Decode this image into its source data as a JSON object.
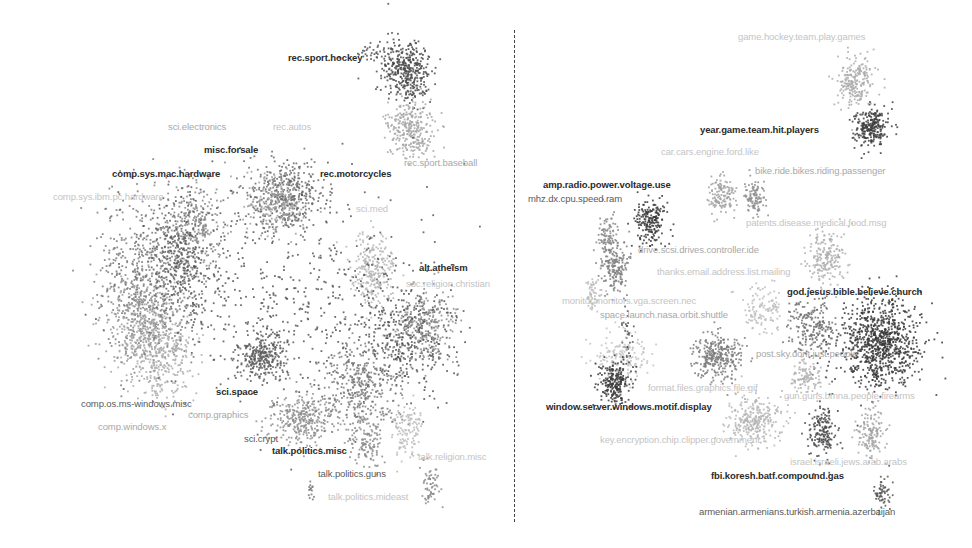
{
  "chart_data": [
    {
      "type": "scatter",
      "title": "",
      "panel": "left",
      "description": "2D embedding of documents colored by newsgroup category",
      "xlabel": "",
      "ylabel": "",
      "axes_visible": false,
      "grid": false,
      "labels": [
        {
          "text": "rec.sport.hockey",
          "x": 288,
          "y": 59,
          "tone": "dark"
        },
        {
          "text": "sci.electronics",
          "x": 168,
          "y": 128,
          "tone": "light"
        },
        {
          "text": "rec.autos",
          "x": 273,
          "y": 128,
          "tone": "faint"
        },
        {
          "text": "misc.forsale",
          "x": 204,
          "y": 151,
          "tone": "dark"
        },
        {
          "text": "comp.sys.mac.hardware",
          "x": 112,
          "y": 175,
          "tone": "dark"
        },
        {
          "text": "rec.motorcycles",
          "x": 320,
          "y": 175,
          "tone": "dark"
        },
        {
          "text": "rec.sport.baseball",
          "x": 404,
          "y": 164,
          "tone": "light"
        },
        {
          "text": "comp.sys.ibm.pc.hardware",
          "x": 53,
          "y": 198,
          "tone": "faint"
        },
        {
          "text": "sci.med",
          "x": 356,
          "y": 210,
          "tone": "faint"
        },
        {
          "text": "alt.atheism",
          "x": 419,
          "y": 269,
          "tone": "dark"
        },
        {
          "text": "soc.religion.christian",
          "x": 406,
          "y": 285,
          "tone": "faint"
        },
        {
          "text": "sci.space",
          "x": 216,
          "y": 393,
          "tone": "dark"
        },
        {
          "text": "comp.os.ms-windows.misc",
          "x": 81,
          "y": 405,
          "tone": "mid"
        },
        {
          "text": "comp.graphics",
          "x": 188,
          "y": 416,
          "tone": "light"
        },
        {
          "text": "comp.windows.x",
          "x": 98,
          "y": 428,
          "tone": "light"
        },
        {
          "text": "sci.crypt",
          "x": 244,
          "y": 440,
          "tone": "mid"
        },
        {
          "text": "talk.politics.misc",
          "x": 272,
          "y": 452,
          "tone": "dark"
        },
        {
          "text": "talk.religion.misc",
          "x": 418,
          "y": 458,
          "tone": "faint"
        },
        {
          "text": "talk.politics.guns",
          "x": 318,
          "y": 475,
          "tone": "mid"
        },
        {
          "text": "talk.politics.mideast",
          "x": 328,
          "y": 498,
          "tone": "faint"
        }
      ],
      "clusters": [
        {
          "name": "rec.sport.hockey",
          "cx": 406,
          "cy": 70,
          "sx": 12,
          "sy": 16,
          "n": 380,
          "shade": "#4a4a4a"
        },
        {
          "name": "rec.sport.baseball",
          "cx": 410,
          "cy": 128,
          "sx": 11,
          "sy": 14,
          "n": 300,
          "shade": "#a6a6a6"
        },
        {
          "name": "hockey-tail",
          "cx": 372,
          "cy": 50,
          "sx": 14,
          "sy": 6,
          "n": 40,
          "shade": "#555555"
        },
        {
          "name": "rec.motorcycles/autos",
          "cx": 285,
          "cy": 195,
          "sx": 20,
          "sy": 18,
          "n": 420,
          "shade": "#6a6a6a"
        },
        {
          "name": "rec.autos-light",
          "cx": 275,
          "cy": 205,
          "sx": 14,
          "sy": 14,
          "n": 200,
          "shade": "#9c9c9c"
        },
        {
          "name": "comp.sys.mac.hardware",
          "cx": 195,
          "cy": 225,
          "sx": 14,
          "sy": 22,
          "n": 260,
          "shade": "#8a8a8a"
        },
        {
          "name": "comp.sys.ibm.pc.hardware",
          "cx": 150,
          "cy": 280,
          "sx": 26,
          "sy": 42,
          "n": 700,
          "shade": "#7a7a7a"
        },
        {
          "name": "sci.electronics",
          "cx": 180,
          "cy": 260,
          "sx": 20,
          "sy": 30,
          "n": 350,
          "shade": "#5a5a5a"
        },
        {
          "name": "comp.os.ms-windows.misc",
          "cx": 158,
          "cy": 350,
          "sx": 18,
          "sy": 22,
          "n": 420,
          "shade": "#aaaaaa"
        },
        {
          "name": "comp.windows.x",
          "cx": 135,
          "cy": 320,
          "sx": 16,
          "sy": 20,
          "n": 260,
          "shade": "#9a9a9a"
        },
        {
          "name": "sci.space",
          "cx": 262,
          "cy": 355,
          "sx": 12,
          "sy": 12,
          "n": 300,
          "shade": "#5c5c5c"
        },
        {
          "name": "sci.med",
          "cx": 372,
          "cy": 268,
          "sx": 10,
          "sy": 18,
          "n": 260,
          "shade": "#b4b4b4"
        },
        {
          "name": "misc-scatter",
          "cx": 300,
          "cy": 300,
          "sx": 70,
          "sy": 55,
          "n": 500,
          "shade": "#555555"
        },
        {
          "name": "alt.atheism",
          "cx": 405,
          "cy": 335,
          "sx": 24,
          "sy": 26,
          "n": 380,
          "shade": "#505050"
        },
        {
          "name": "soc.religion.christian",
          "cx": 425,
          "cy": 325,
          "sx": 16,
          "sy": 22,
          "n": 260,
          "shade": "#8c8c8c"
        },
        {
          "name": "sci.crypt",
          "cx": 300,
          "cy": 420,
          "sx": 16,
          "sy": 12,
          "n": 320,
          "shade": "#8e8e8e"
        },
        {
          "name": "talk.politics.misc",
          "cx": 360,
          "cy": 385,
          "sx": 22,
          "sy": 22,
          "n": 400,
          "shade": "#7c7c7c"
        },
        {
          "name": "talk.politics.guns",
          "cx": 365,
          "cy": 440,
          "sx": 8,
          "sy": 14,
          "n": 120,
          "shade": "#8a8a8a"
        },
        {
          "name": "talk.religion.misc",
          "cx": 408,
          "cy": 430,
          "sx": 8,
          "sy": 16,
          "n": 120,
          "shade": "#b8b8b8"
        },
        {
          "name": "talk.politics.mideast",
          "cx": 430,
          "cy": 485,
          "sx": 5,
          "sy": 10,
          "n": 60,
          "shade": "#888888"
        },
        {
          "name": "guns-tail",
          "cx": 310,
          "cy": 490,
          "sx": 2,
          "sy": 6,
          "n": 15,
          "shade": "#777777"
        }
      ]
    },
    {
      "type": "scatter",
      "title": "",
      "panel": "right",
      "description": "2D embedding of documents with topic-keyword cluster labels",
      "xlabel": "",
      "ylabel": "",
      "axes_visible": false,
      "grid": false,
      "labels": [
        {
          "text": "game.hockey.team.play.games",
          "x": 738,
          "y": 38,
          "tone": "faint"
        },
        {
          "text": "year.game.team.hit.players",
          "x": 700,
          "y": 131,
          "tone": "dark"
        },
        {
          "text": "car.cars.engine.ford.like",
          "x": 661,
          "y": 153,
          "tone": "faint"
        },
        {
          "text": "bike.ride.bikes.riding.passenger",
          "x": 755,
          "y": 172,
          "tone": "light"
        },
        {
          "text": "amp.radio.power.voltage.use",
          "x": 543,
          "y": 186,
          "tone": "dark"
        },
        {
          "text": "mhz.dx.cpu.speed.ram",
          "x": 528,
          "y": 200,
          "tone": "mid"
        },
        {
          "text": "patents.disease.medical.food.msg",
          "x": 746,
          "y": 224,
          "tone": "faint"
        },
        {
          "text": "drive.scsi.drives.controller.ide",
          "x": 638,
          "y": 251,
          "tone": "light"
        },
        {
          "text": "thanks.email.address.list.mailing",
          "x": 657,
          "y": 273,
          "tone": "faint"
        },
        {
          "text": "god.jesus.bible.believe.church",
          "x": 787,
          "y": 293,
          "tone": "dark"
        },
        {
          "text": "monitor.monitors.vga.screen.nec",
          "x": 562,
          "y": 302,
          "tone": "faint"
        },
        {
          "text": "space.launch.nasa.orbit.shuttle",
          "x": 600,
          "y": 316,
          "tone": "light"
        },
        {
          "text": "post.sky.dont.just.people",
          "x": 756,
          "y": 355,
          "tone": "light"
        },
        {
          "text": "format.files.graphics.file.gif",
          "x": 648,
          "y": 389,
          "tone": "faint"
        },
        {
          "text": "gun.guns.bmna.people.firearms",
          "x": 784,
          "y": 397,
          "tone": "faint"
        },
        {
          "text": "window.server.windows.motif.display",
          "x": 546,
          "y": 408,
          "tone": "dark"
        },
        {
          "text": "key.encryption.chip.clipper.government",
          "x": 600,
          "y": 441,
          "tone": "faint"
        },
        {
          "text": "israel.israeli.jews.arab.arabs",
          "x": 790,
          "y": 463,
          "tone": "faint"
        },
        {
          "text": "fbi.koresh.batf.compound.gas",
          "x": 711,
          "y": 477,
          "tone": "dark"
        },
        {
          "text": "armenian.armenians.turkish.armenia.azerbaijan",
          "x": 699,
          "y": 513,
          "tone": "mid"
        }
      ],
      "clusters": [
        {
          "name": "game.hockey.team.play.games",
          "cx": 855,
          "cy": 80,
          "sx": 9,
          "sy": 13,
          "n": 220,
          "shade": "#aaaaaa"
        },
        {
          "name": "year.game.team.hit.players",
          "cx": 870,
          "cy": 127,
          "sx": 8,
          "sy": 9,
          "n": 260,
          "shade": "#3e3e3e"
        },
        {
          "name": "car.cars.engine.ford.like",
          "cx": 722,
          "cy": 192,
          "sx": 7,
          "sy": 9,
          "n": 130,
          "shade": "#a0a0a0"
        },
        {
          "name": "bike.ride.bikes.riding.passenger",
          "cx": 753,
          "cy": 197,
          "sx": 5,
          "sy": 9,
          "n": 110,
          "shade": "#8e8e8e"
        },
        {
          "name": "amp.radio.power.voltage.use",
          "cx": 650,
          "cy": 222,
          "sx": 7,
          "sy": 12,
          "n": 200,
          "shade": "#3a3a3a"
        },
        {
          "name": "mhz.dx.cpu.speed.ram",
          "cx": 607,
          "cy": 238,
          "sx": 5,
          "sy": 12,
          "n": 110,
          "shade": "#888888"
        },
        {
          "name": "drive.scsi.drives.controller.ide",
          "cx": 615,
          "cy": 268,
          "sx": 7,
          "sy": 12,
          "n": 160,
          "shade": "#7e7e7e"
        },
        {
          "name": "patents.disease.medical.food.msg",
          "cx": 827,
          "cy": 258,
          "sx": 10,
          "sy": 14,
          "n": 200,
          "shade": "#aeaeae"
        },
        {
          "name": "monitor.monitors.vga.screen.nec",
          "cx": 592,
          "cy": 292,
          "sx": 5,
          "sy": 8,
          "n": 60,
          "shade": "#bbbbbb"
        },
        {
          "name": "thanks.email.address.list.mailing",
          "cx": 763,
          "cy": 310,
          "sx": 10,
          "sy": 12,
          "n": 120,
          "shade": "#bcbcbc"
        },
        {
          "name": "god.jesus.bible.believe.church",
          "cx": 880,
          "cy": 340,
          "sx": 20,
          "sy": 22,
          "n": 900,
          "shade": "#383838"
        },
        {
          "name": "post.sky.dont.just.people",
          "cx": 812,
          "cy": 330,
          "sx": 12,
          "sy": 14,
          "n": 220,
          "shade": "#6e6e6e"
        },
        {
          "name": "space.launch.nasa.orbit.shuttle",
          "cx": 717,
          "cy": 355,
          "sx": 12,
          "sy": 12,
          "n": 300,
          "shade": "#7a7a7a"
        },
        {
          "name": "space-thread",
          "cx": 626,
          "cy": 335,
          "sx": 3,
          "sy": 12,
          "n": 35,
          "shade": "#555555"
        },
        {
          "name": "format.files.graphics.file.gif",
          "cx": 620,
          "cy": 355,
          "sx": 14,
          "sy": 12,
          "n": 150,
          "shade": "#c2c2c2"
        },
        {
          "name": "window.server.windows.motif.display",
          "cx": 615,
          "cy": 382,
          "sx": 8,
          "sy": 11,
          "n": 240,
          "shade": "#3c3c3c"
        },
        {
          "name": "gun.guns.bmna.people.firearms",
          "cx": 805,
          "cy": 377,
          "sx": 8,
          "sy": 9,
          "n": 110,
          "shade": "#b0b0b0"
        },
        {
          "name": "key.encryption.chip.clipper.government",
          "cx": 755,
          "cy": 420,
          "sx": 13,
          "sy": 12,
          "n": 300,
          "shade": "#b6b6b6"
        },
        {
          "name": "fbi.koresh.batf.compound.gas",
          "cx": 822,
          "cy": 432,
          "sx": 7,
          "sy": 14,
          "n": 170,
          "shade": "#484848"
        },
        {
          "name": "israel.israeli.jews.arab.arabs",
          "cx": 870,
          "cy": 432,
          "sx": 7,
          "sy": 14,
          "n": 150,
          "shade": "#a2a2a2"
        },
        {
          "name": "armenian.armenians.turkish.armenia.azerbaijan",
          "cx": 882,
          "cy": 492,
          "sx": 4,
          "sy": 9,
          "n": 60,
          "shade": "#555555"
        }
      ]
    }
  ],
  "figure": {
    "divider": {
      "x": 514,
      "style": "dashed"
    },
    "background": "#ffffff"
  }
}
